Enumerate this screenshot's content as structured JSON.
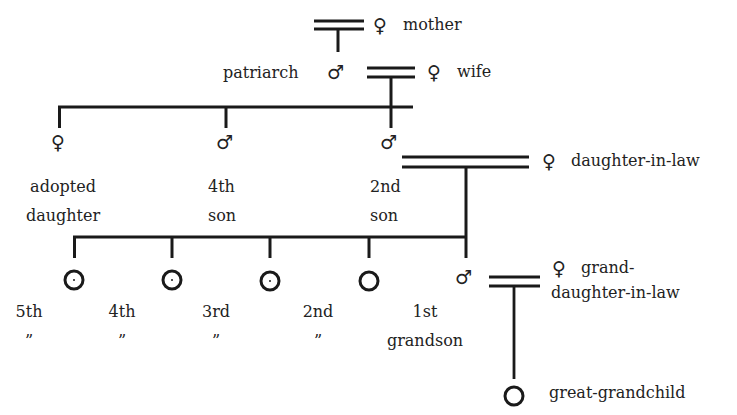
{
  "diagram": {
    "type": "kinship-chart",
    "colors": {
      "line": "#1a1a1a",
      "text": "#222222",
      "background": "#ffffff"
    },
    "symbols": {
      "male": "♂",
      "female": "♀",
      "unknown_sex": "○"
    },
    "generation_1": {
      "mother": {
        "symbol": "♀",
        "label": "mother"
      },
      "patriarch": {
        "symbol": "♂",
        "label": "patriarch"
      },
      "wife": {
        "symbol": "♀",
        "label": "wife"
      }
    },
    "generation_2": {
      "children": [
        {
          "symbol": "♀",
          "label_line1": "adopted",
          "label_line2": "daughter"
        },
        {
          "symbol": "♂",
          "label_line1": "4th",
          "label_line2": "son"
        },
        {
          "symbol": "♂",
          "label_line1": "2nd",
          "label_line2": "son"
        }
      ],
      "daughter_in_law": {
        "symbol": "♀",
        "label": "daughter-in-law"
      }
    },
    "generation_3": {
      "children": [
        {
          "symbol": "○",
          "label_line1": "5th",
          "label_line2": "”"
        },
        {
          "symbol": "○",
          "label_line1": "4th",
          "label_line2": "”"
        },
        {
          "symbol": "○",
          "label_line1": "3rd",
          "label_line2": "”"
        },
        {
          "symbol": "○",
          "label_line1": "2nd",
          "label_line2": "”"
        },
        {
          "symbol": "♂",
          "label_line1": "1st",
          "label_line2": "grandson"
        }
      ],
      "granddaughter_in_law": {
        "symbol": "♀",
        "label_line1": "grand-",
        "label_line2": "daughter-in-law"
      }
    },
    "generation_4": {
      "great_grandchild": {
        "symbol": "○",
        "label": "great-grandchild"
      }
    }
  }
}
